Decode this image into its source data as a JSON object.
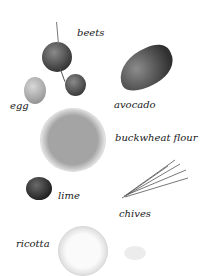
{
  "labels": {
    "beets": "beets",
    "egg": "egg",
    "avocado": "avocado",
    "buckwheat_flour": "buckwheat flour",
    "lime": "lime",
    "chives": "chives",
    "ricotta": "ricotta"
  },
  "colors": {
    "background": "#ffffff",
    "text": "#1a1a1a",
    "avocado": "#4a4a4a",
    "beet": "#555555",
    "egg": "#b8b8b8",
    "flour": "#9a9a9a",
    "lime": "#2e2e2e",
    "ricotta": "#eeeeee"
  }
}
